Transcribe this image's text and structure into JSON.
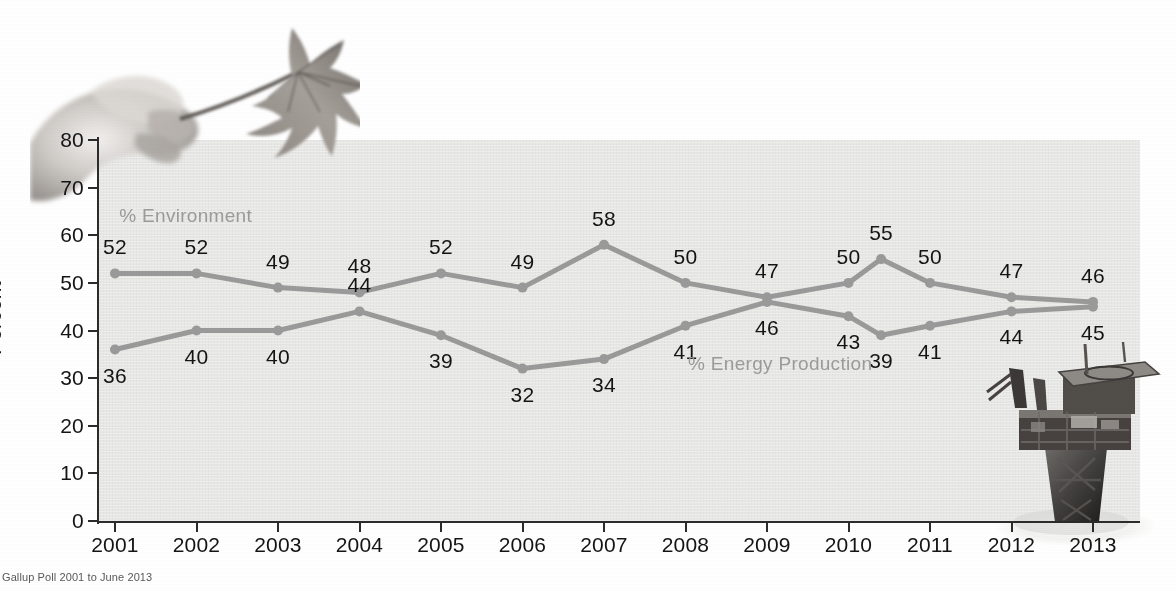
{
  "figure": {
    "axis_title_y": "Percent",
    "source_note": "Gallup Poll 2001 to June 2013"
  },
  "chart_data": {
    "type": "line",
    "title": "",
    "subtitle": "",
    "xlabel": "",
    "ylabel": "Percent",
    "ylim": [
      0,
      80
    ],
    "yticks": [
      0,
      10,
      20,
      30,
      40,
      50,
      60,
      70,
      80
    ],
    "grid": false,
    "legend_position": "inline-annotation",
    "categories": [
      "2001",
      "2002",
      "2003",
      "2004",
      "2005",
      "2006",
      "2007",
      "2008",
      "2009",
      "2010",
      "",
      "2011",
      "2012",
      "2013"
    ],
    "tick_categories": [
      "2001",
      "2002",
      "2003",
      "2004",
      "2005",
      "2006",
      "2007",
      "2008",
      "2009",
      "2010",
      "2011",
      "2012",
      "2013"
    ],
    "series": [
      {
        "name": "% Environment",
        "color": "#9a9a9a",
        "values": [
          52,
          52,
          49,
          48,
          52,
          49,
          58,
          50,
          47,
          50,
          55,
          50,
          47,
          46
        ],
        "labels": [
          "52",
          "52",
          "49",
          "48",
          "52",
          "49",
          "58",
          "50",
          "47",
          "50",
          "55",
          "50",
          "47",
          "46"
        ],
        "label_position": [
          "above",
          "above",
          "above",
          "above",
          "above",
          "above",
          "above",
          "above",
          "above",
          "above",
          "above",
          "above",
          "above",
          "above"
        ]
      },
      {
        "name": "% Energy Production",
        "color": "#9a9a9a",
        "values": [
          36,
          40,
          40,
          44,
          39,
          32,
          34,
          41,
          46,
          43,
          39,
          41,
          44,
          45
        ],
        "labels": [
          "36",
          "40",
          "40",
          "44",
          "39",
          "32",
          "34",
          "41",
          "46",
          "43",
          "39",
          "41",
          "44",
          "45"
        ],
        "label_position": [
          "below",
          "below",
          "below",
          "above",
          "below",
          "below",
          "below",
          "below",
          "below",
          "below",
          "below",
          "below",
          "below",
          "below"
        ]
      }
    ],
    "annotations": [
      {
        "text": "% Environment",
        "x_frac": 0.085,
        "y_value": 64,
        "color": "#9b9b9b"
      },
      {
        "text": "% Energy Production",
        "x_frac": 0.655,
        "y_value": 33,
        "color": "#9b9b9b"
      }
    ],
    "images": [
      {
        "name": "hand-holding-dried-leaf",
        "position": "top-left"
      },
      {
        "name": "offshore-oil-platform",
        "position": "bottom-right"
      }
    ]
  }
}
